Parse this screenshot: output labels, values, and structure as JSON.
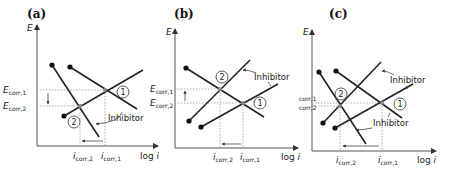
{
  "panels": [
    {
      "id": "a",
      "label": "(a)",
      "y_axis": "E",
      "x_axis_prefix": "log",
      "x_axis_var": "i",
      "e_corr_1": {
        "main": "E",
        "sub": "corr,1"
      },
      "e_corr_2": {
        "main": "E",
        "sub": "corr,2"
      },
      "i_corr_2": {
        "main": "i",
        "sub": "corr,2"
      },
      "i_corr_1": {
        "main": "i",
        "sub": "corr,1"
      },
      "point_1": "1",
      "point_2": "2",
      "annotation": "Inhibitor",
      "description": "Cathodic inhibitor: cathodic line shifts down-left; Ecorr decreases, icorr decreases"
    },
    {
      "id": "b",
      "label": "(b)",
      "y_axis": "E",
      "x_axis_prefix": "log",
      "x_axis_var": "i",
      "e_corr_1": {
        "main": "E",
        "sub": "corr,1"
      },
      "e_corr_2": {
        "main": "E",
        "sub": "corr,2"
      },
      "i_corr_2": {
        "main": "i",
        "sub": "corr,2"
      },
      "i_corr_1": {
        "main": "i",
        "sub": "corr,1"
      },
      "point_1": "1",
      "point_2": "2",
      "annotation": "Inhibitor",
      "description": "Anodic inhibitor: anodic line shifts up-left; Ecorr increases, icorr decreases"
    },
    {
      "id": "c",
      "label": "(c)",
      "y_axis": "E",
      "x_axis_prefix": "log",
      "x_axis_var": "i",
      "e_corr_1": {
        "main": "E",
        "sub": "corr,1"
      },
      "e_corr_2": {
        "main": "E",
        "sub": "corr,2"
      },
      "i_corr_2": {
        "main": "i",
        "sub": "corr,2"
      },
      "i_corr_1": {
        "main": "i",
        "sub": "corr,1"
      },
      "point_1": "1",
      "point_2": "2",
      "annotation_top": "Inhibitor",
      "annotation_bottom": "Inhibitor",
      "description": "Mixed inhibitor: both lines shift; Ecorr approximately unchanged, icorr decreases"
    }
  ]
}
